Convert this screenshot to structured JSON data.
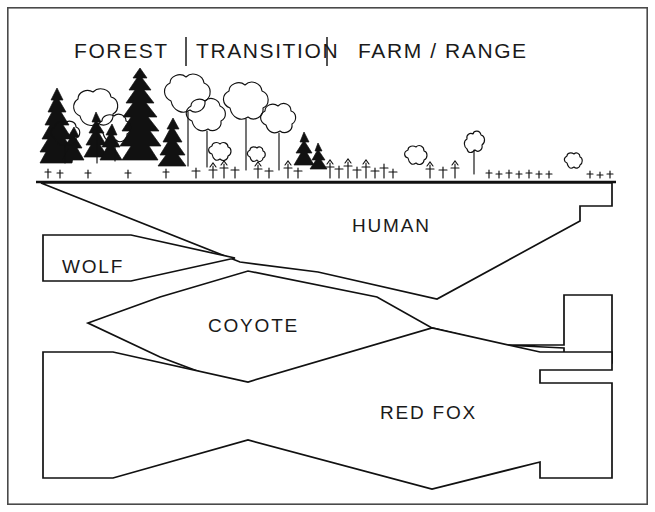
{
  "figure": {
    "title_zones": [
      {
        "id": "forest",
        "label": "FOREST",
        "x": 74,
        "y": 58
      },
      {
        "id": "transition",
        "label": "TRANSITION",
        "x": 196,
        "y": 58
      },
      {
        "id": "farm-range",
        "label": "FARM / RANGE",
        "x": 358,
        "y": 58
      }
    ],
    "zone_dividers": [
      {
        "id": "divider-left",
        "x": 186,
        "y1": 37,
        "y2": 66
      },
      {
        "id": "divider-right",
        "x": 327,
        "y1": 37,
        "y2": 66
      }
    ],
    "species_bands": [
      {
        "id": "human",
        "label": "HUMAN",
        "label_x": 352,
        "label_y": 232,
        "points": "41,183 612,183 612,206 580,206 580,221 437,299 318,272 240,262 41,183"
      },
      {
        "id": "wolf",
        "label": "WOLF",
        "label_x": 62,
        "label_y": 273,
        "points": "43,235 131,235 235,258 131,281 43,281 43,235"
      },
      {
        "id": "coyote",
        "label": "COYOTE",
        "label_x": 208,
        "label_y": 332,
        "points": "88,323 160,297 248,271 377,297 432,328 503,345 564,345 564,295 612,295 612,363 564,363 564,348 432,328 340,368 248,390 160,357 88,323"
      },
      {
        "id": "red-fox",
        "label": "RED FOX",
        "label_x": 380,
        "label_y": 419,
        "points": "43,352 113,352 248,382 432,328 540,352 612,352 612,370 540,370 540,383 612,383 612,478 540,478 540,462 432,489 248,440 113,478 43,478 43,352"
      }
    ],
    "ground": {
      "id": "ground-line",
      "x1": 36,
      "y1": 182,
      "x2": 616,
      "y2": 182
    },
    "frame": {
      "x": 7,
      "y": 7,
      "width": 641,
      "height": 498
    },
    "colors": {
      "ink": "#111111",
      "frame": "#4a4a4a",
      "background": "#ffffff"
    },
    "vegetation": {
      "description": "forest-to-farmland vegetation profile",
      "conifer_count": 9,
      "deciduous_count": 11,
      "shrub_count": 5,
      "grass_tuft_rows": 1
    }
  }
}
